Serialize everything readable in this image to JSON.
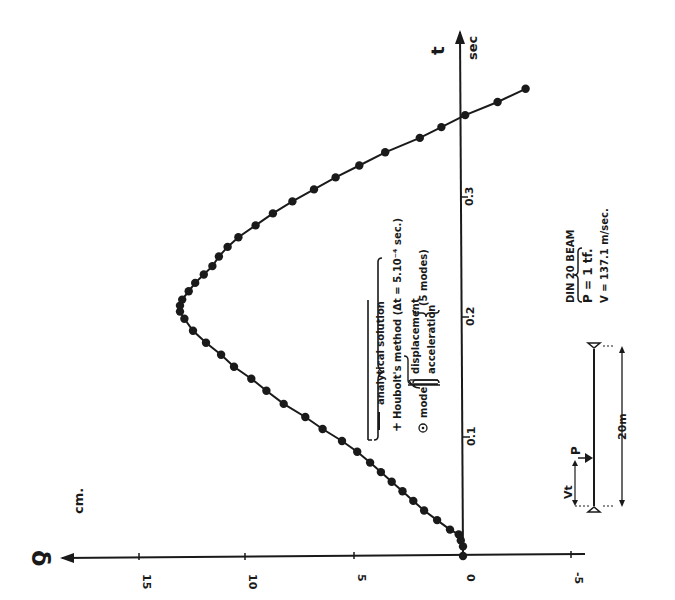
{
  "chart_data": {
    "type": "line",
    "orientation": "rotated-90 (time axis points up, deflection axis points left)",
    "title": "",
    "xlabel": "t",
    "xunit": "sec",
    "ylabel": "δ",
    "yunit": "cm.",
    "x_ticks": [
      "0.1",
      "0.2",
      "0.3"
    ],
    "y_ticks": [
      "15",
      "10",
      "5",
      "0",
      "-5"
    ],
    "xlim": [
      0,
      0.35
    ],
    "ylim": [
      -5,
      17
    ],
    "grid": false,
    "series": [
      {
        "name": "analytical solution / Houbolt's method / mode superposition",
        "marker": "filled circle",
        "x": [
          0.0,
          0.008,
          0.013,
          0.018,
          0.022,
          0.03,
          0.038,
          0.046,
          0.054,
          0.062,
          0.07,
          0.078,
          0.087,
          0.096,
          0.106,
          0.116,
          0.127,
          0.138,
          0.148,
          0.158,
          0.168,
          0.178,
          0.188,
          0.198,
          0.204,
          0.209,
          0.214,
          0.221,
          0.228,
          0.235,
          0.242,
          0.25,
          0.258,
          0.266,
          0.276,
          0.286,
          0.296,
          0.306,
          0.316,
          0.326,
          0.337,
          0.349,
          0.358,
          0.368,
          0.379,
          0.39
        ],
        "values": [
          0.0,
          0.0,
          0.1,
          0.2,
          0.6,
          1.2,
          1.8,
          2.3,
          2.8,
          3.3,
          3.8,
          4.3,
          4.9,
          5.6,
          6.5,
          7.3,
          8.3,
          9.1,
          9.8,
          10.6,
          11.2,
          11.9,
          12.5,
          12.9,
          13.1,
          13.1,
          13.0,
          12.7,
          12.4,
          12.0,
          11.6,
          11.3,
          10.9,
          10.4,
          9.6,
          8.8,
          7.9,
          6.9,
          5.9,
          4.8,
          3.6,
          2.0,
          1.0,
          -0.1,
          -1.6,
          -2.9
        ]
      }
    ],
    "legend": {
      "items": [
        {
          "symbol": "line",
          "label": "analytical solution"
        },
        {
          "symbol": "+",
          "label": "Houbolt's method (Δt = 5.10⁻⁴ sec.)"
        },
        {
          "symbol": "⊙",
          "label": "mode",
          "sub": [
            "displacement",
            "acceleration"
          ],
          "note": "(5 modes)"
        }
      ]
    },
    "annotations": {
      "beam_title": "DIN 20 BEAM",
      "load": "P = 1 tf.",
      "velocity": "V = 137.1 m/sec.",
      "span": "20m",
      "position_label": "Vt",
      "load_label": "P"
    }
  }
}
